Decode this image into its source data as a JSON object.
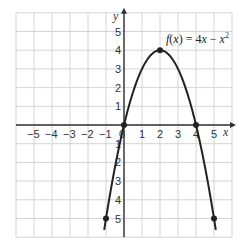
{
  "chart_data": {
    "type": "line",
    "title": "",
    "function_label": "f(x) = 4x − x²",
    "label_parts": {
      "f": "f",
      "open": "(",
      "x1": "x",
      "close": ")",
      "eq": " = 4",
      "x2": "x",
      "minus": " − ",
      "x3": "x",
      "exp": "2"
    },
    "xlabel": "x",
    "ylabel": "y",
    "xlim": [
      -6,
      6
    ],
    "ylim": [
      -6,
      6
    ],
    "grid": true,
    "x_ticks": [
      -5,
      -4,
      -3,
      -2,
      -1,
      0,
      1,
      2,
      3,
      4,
      5
    ],
    "x_tick_labels": [
      "−5",
      "−4",
      "−3",
      "−2",
      "−1",
      "0",
      "1",
      "2",
      "3",
      "4",
      "5"
    ],
    "y_ticks": [
      5,
      4,
      3,
      2,
      1,
      -1,
      -2,
      -3,
      -4,
      -5
    ],
    "y_tick_labels": [
      "5",
      "4",
      "3",
      "2",
      "1",
      "1",
      "2",
      "3",
      "4",
      "5"
    ],
    "series": [
      {
        "name": "f(x) = 4x − x²",
        "expression": "4x - x^2",
        "x_range": [
          -1.1,
          5.1
        ],
        "color": "#222222"
      }
    ],
    "marked_points": [
      {
        "x": -1,
        "y": -5
      },
      {
        "x": 0,
        "y": 0
      },
      {
        "x": 2,
        "y": 4
      },
      {
        "x": 4,
        "y": 0
      },
      {
        "x": 5,
        "y": -5
      }
    ],
    "colors": {
      "grid": "#d4d4d4",
      "axis": "#333333",
      "curve": "#222222",
      "background": "#ffffff"
    }
  }
}
